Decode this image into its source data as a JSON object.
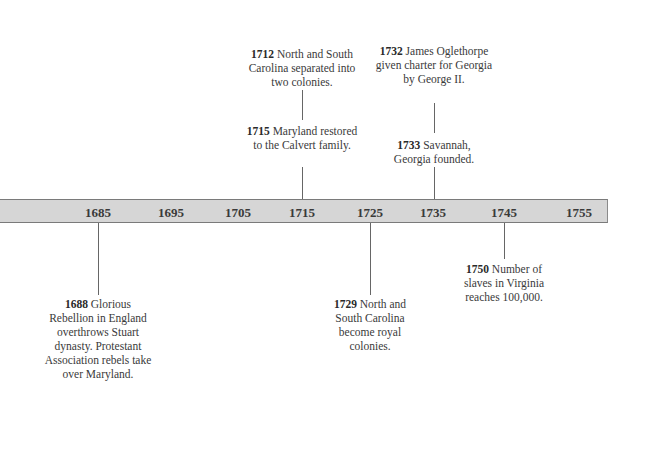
{
  "timeline": {
    "ticks": [
      {
        "label": "1685",
        "x": 98
      },
      {
        "label": "1695",
        "x": 171
      },
      {
        "label": "1705",
        "x": 238
      },
      {
        "label": "1715",
        "x": 302
      },
      {
        "label": "1725",
        "x": 370
      },
      {
        "label": "1735",
        "x": 433
      },
      {
        "label": "1745",
        "x": 504
      },
      {
        "label": "1755",
        "x": 579
      }
    ],
    "events_above": [
      {
        "year": "1712",
        "text": "North and South Carolina separated into two colonies."
      },
      {
        "year": "1715",
        "text": "Maryland restored to the Calvert family."
      },
      {
        "year": "1732",
        "text": "James Oglethorpe given charter for Georgia by George II."
      },
      {
        "year": "1733",
        "text": "Savannah, Georgia founded."
      }
    ],
    "events_below": [
      {
        "year": "1688",
        "text": "Glorious Rebellion in England overthrows Stuart dynasty. Protestant Association rebels take over Maryland."
      },
      {
        "year": "1729",
        "text": "North and South Carolina become royal colonies."
      },
      {
        "year": "1750",
        "text": "Number of slaves in Virginia reaches 100,000."
      }
    ]
  },
  "colors": {
    "bar_fill": "#d6d6d6",
    "bar_border": "#7a7a7a",
    "line": "#666666",
    "text": "#333333"
  }
}
